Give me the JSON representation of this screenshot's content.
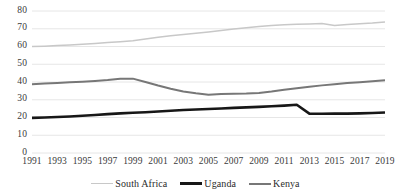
{
  "chart_data": {
    "type": "line",
    "title": "",
    "subtitle": "",
    "xlabel": "",
    "ylabel": "",
    "xlim": [
      1991,
      2019
    ],
    "ylim": [
      0,
      80
    ],
    "ytick_step": 10,
    "yticks": [
      "80",
      "70",
      "60",
      "50",
      "40",
      "30",
      "20",
      "10",
      "0"
    ],
    "grid": "horizontal",
    "legend_position": "bottom",
    "x": [
      1991,
      1992,
      1993,
      1994,
      1995,
      1996,
      1997,
      1998,
      1999,
      2000,
      2001,
      2002,
      2003,
      2004,
      2005,
      2006,
      2007,
      2008,
      2009,
      2010,
      2011,
      2012,
      2013,
      2014,
      2015,
      2016,
      2017,
      2018,
      2019
    ],
    "xticks": [
      "1991",
      "1993",
      "1995",
      "1997",
      "1999",
      "2001",
      "2003",
      "2005",
      "2007",
      "2009",
      "2011",
      "2013",
      "2015",
      "2017",
      "2019"
    ],
    "series": [
      {
        "name": "South Africa",
        "color": "#c8c8c8",
        "width": 1.5,
        "values": [
          60.0,
          60.2,
          60.5,
          60.9,
          61.3,
          61.7,
          62.2,
          62.7,
          63.3,
          64.2,
          65.2,
          66.0,
          66.8,
          67.5,
          68.2,
          69.0,
          69.8,
          70.6,
          71.3,
          71.9,
          72.3,
          72.5,
          72.7,
          72.9,
          71.8,
          72.4,
          72.8,
          73.2,
          73.8
        ]
      },
      {
        "name": "Uganda",
        "color": "#171717",
        "width": 2.6,
        "values": [
          19.8,
          20.0,
          20.3,
          20.6,
          21.0,
          21.4,
          21.9,
          22.3,
          22.7,
          23.0,
          23.4,
          23.8,
          24.2,
          24.5,
          24.8,
          25.1,
          25.4,
          25.7,
          26.0,
          26.3,
          26.7,
          27.2,
          22.2,
          22.1,
          22.2,
          22.2,
          22.3,
          22.5,
          22.8
        ]
      },
      {
        "name": "Kenya",
        "color": "#777777",
        "width": 2.0,
        "values": [
          38.8,
          39.1,
          39.4,
          39.8,
          40.2,
          40.6,
          41.1,
          41.8,
          41.9,
          40.0,
          38.0,
          36.2,
          34.6,
          33.6,
          32.8,
          33.2,
          33.4,
          33.5,
          33.8,
          34.6,
          35.6,
          36.5,
          37.3,
          38.1,
          38.8,
          39.4,
          39.9,
          40.4,
          41.0
        ]
      }
    ]
  },
  "legend": {
    "items": [
      {
        "label": "South Africa"
      },
      {
        "label": "Uganda"
      },
      {
        "label": "Kenya"
      }
    ]
  },
  "colors": {
    "south_africa": "#c8c8c8",
    "uganda": "#171717",
    "kenya": "#777777",
    "gridline": "#e3e3e3",
    "axis_text": "#3a3a3a",
    "background": "#ffffff"
  }
}
